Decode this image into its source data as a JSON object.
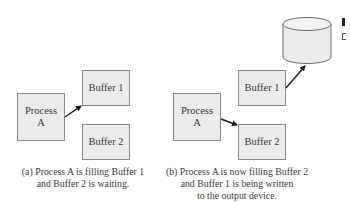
{
  "panel_a": {
    "process": {
      "label_line1": "Process",
      "label_line2": "A"
    },
    "buffer1": {
      "label": "Buffer 1"
    },
    "buffer2": {
      "label": "Buffer 2"
    },
    "caption_line1": "(a) Process A is filling Buffer 1",
    "caption_line2": "and Buffer 2 is waiting."
  },
  "panel_b": {
    "process": {
      "label_line1": "Process",
      "label_line2": "A"
    },
    "buffer1": {
      "label": "Buffer 1"
    },
    "buffer2": {
      "label": "Buffer 2"
    },
    "output_device": {
      "shape": "cylinder-icon"
    },
    "caption_line1": "(b) Process A is now filling Buffer 2",
    "caption_line2": "and Buffer 1 is being written",
    "caption_line3": "to the output device."
  },
  "colors": {
    "box_fill": "#ebebeb",
    "box_border": "#8a8a8a",
    "arrow": "#1a1a1a",
    "text": "#3a3a3a"
  }
}
